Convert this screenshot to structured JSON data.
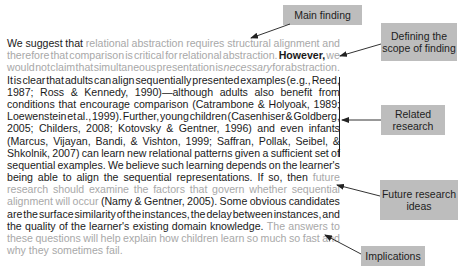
{
  "passage": {
    "lines": [
      [
        {
          "t": "We suggest that ",
          "c": "d"
        },
        {
          "t": "relational abstraction requires structural alignment and",
          "c": "g"
        }
      ],
      [
        {
          "t": "therefore that comparison is critical for relational abstraction. ",
          "c": "g"
        },
        {
          "t": "However,",
          "c": "d b"
        },
        {
          "t": " we",
          "c": "g"
        }
      ],
      [
        {
          "t": "would not claim that simultaneous presentation is ",
          "c": "g"
        },
        {
          "t": "necessary",
          "c": "g it"
        },
        {
          "t": " for abstraction.",
          "c": "g"
        }
      ],
      [
        {
          "t": "It is clear that adults can align sequentially presented examples (e.g., Reed,",
          "c": "d"
        }
      ],
      [
        {
          "t": "1987; Ross & Kennedy, 1990)—although adults also benefit from",
          "c": "d"
        }
      ],
      [
        {
          "t": "conditions that encourage comparison (Catrambone & Holyoak, 1989;",
          "c": "d"
        }
      ],
      [
        {
          "t": "Loewenstein et al., 1999). Further, young children (Casenhiser & Goldberg,",
          "c": "d"
        }
      ],
      [
        {
          "t": "2005; Childers, 2008; Kotovsky & Gentner, 1996) and even infants",
          "c": "d"
        }
      ],
      [
        {
          "t": "(Marcus, Vijayan, Bandi, & Vishton, 1999; Saffran, Pollak, Seibel, &",
          "c": "d"
        }
      ],
      [
        {
          "t": "Shkolnik, 2007) can learn new relational patterns given a sufficient set of",
          "c": "d"
        }
      ],
      [
        {
          "t": "sequential examples. We believe such learning depends on the learner's",
          "c": "d"
        }
      ],
      [
        {
          "t": "being able to align the sequential representations. If so, then ",
          "c": "d"
        },
        {
          "t": "future",
          "c": "g"
        }
      ],
      [
        {
          "t": "research should examine the factors that govern whether sequential",
          "c": "g"
        }
      ],
      [
        {
          "t": "alignment will occur ",
          "c": "g"
        },
        {
          "t": "(Namy & Gentner, 2005). Some obvious candidates",
          "c": "d"
        }
      ],
      [
        {
          "t": "are the surface similarity of the instances, the delay between instances, and",
          "c": "d"
        }
      ],
      [
        {
          "t": "the quality of the learner's existing domain knowledge. ",
          "c": "d"
        },
        {
          "t": "The answers to",
          "c": "g"
        }
      ],
      [
        {
          "t": "these questions will help explain how children learn so much so fast and",
          "c": "g"
        }
      ],
      [
        {
          "t": "why they sometimes fail.",
          "c": "g"
        }
      ]
    ]
  },
  "annotations": {
    "main_finding": "Main finding",
    "scope_line1": "Defining the",
    "scope_line2": "scope of finding",
    "related_line1": "Related",
    "related_line2": "research",
    "future_line1": "Future research",
    "future_line2": "ideas",
    "implications": "Implications"
  },
  "colors": {
    "box_fill": "#bdbdbd",
    "dark_text": "#1a1a1a",
    "gray_text": "#a8a8a8"
  }
}
